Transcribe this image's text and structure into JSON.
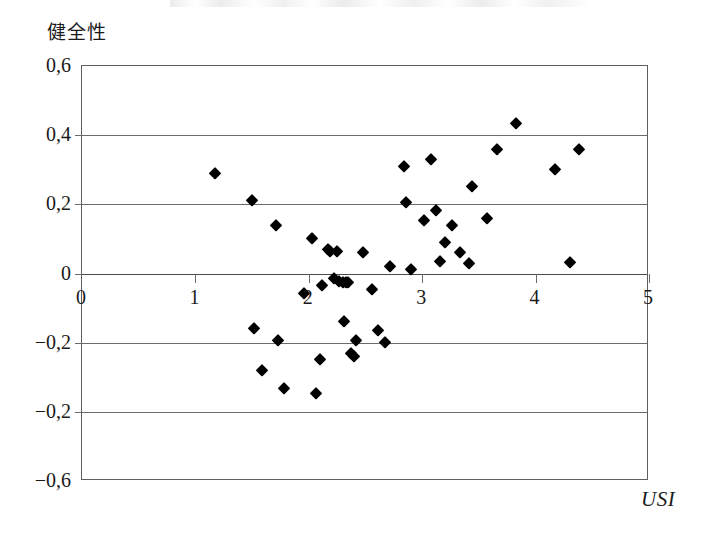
{
  "figure": {
    "y_axis_title": "健全性",
    "x_axis_title": "USI"
  },
  "chart_data": {
    "type": "scatter",
    "title": "",
    "xlabel": "USI",
    "ylabel": "健全性",
    "xlim": [
      0,
      5
    ],
    "ylim": [
      -0.6,
      0.6
    ],
    "xticks": [
      0,
      1,
      2,
      3,
      4,
      5
    ],
    "xtick_labels": [
      "0",
      "1",
      "2",
      "3",
      "4",
      "5"
    ],
    "yticks": [
      0.6,
      0.4,
      0.2,
      0,
      -0.2,
      -0.4,
      -0.6
    ],
    "ytick_labels": [
      "0,6",
      "0,4",
      "0,2",
      "0",
      "−0,2",
      "−0,2",
      "−0,6"
    ],
    "ytick_label_note": "The fourth-from-bottom label is printed as −0,2 in the original (duplicate of the −0,2 above it); by position it denotes −0,4.",
    "grid": "horizontal gridlines at y = 0.4, 0.2, 0, -0.2, -0.4",
    "legend": null,
    "marker": "filled diamond",
    "marker_color": "#000000",
    "n_points": 47,
    "points": [
      [
        1.17,
        0.292
      ],
      [
        1.5,
        0.213
      ],
      [
        1.52,
        -0.157
      ],
      [
        1.59,
        -0.278
      ],
      [
        1.71,
        0.139
      ],
      [
        1.73,
        -0.192
      ],
      [
        1.78,
        -0.331
      ],
      [
        1.96,
        -0.055
      ],
      [
        2.03,
        0.104
      ],
      [
        2.06,
        -0.345
      ],
      [
        2.1,
        -0.246
      ],
      [
        2.12,
        -0.033
      ],
      [
        2.17,
        0.071
      ],
      [
        2.19,
        0.066
      ],
      [
        2.22,
        -0.012
      ],
      [
        2.25,
        0.064
      ],
      [
        2.27,
        -0.021
      ],
      [
        2.3,
        -0.025
      ],
      [
        2.31,
        -0.138
      ],
      [
        2.33,
        -0.026
      ],
      [
        2.35,
        -0.024
      ],
      [
        2.37,
        -0.229
      ],
      [
        2.4,
        -0.238
      ],
      [
        2.42,
        -0.192
      ],
      [
        2.48,
        0.062
      ],
      [
        2.56,
        -0.044
      ],
      [
        2.61,
        -0.162
      ],
      [
        2.67,
        -0.198
      ],
      [
        2.72,
        0.021
      ],
      [
        2.84,
        0.31
      ],
      [
        2.86,
        0.208
      ],
      [
        2.9,
        0.012
      ],
      [
        3.02,
        0.155
      ],
      [
        3.08,
        0.331
      ],
      [
        3.12,
        0.183
      ],
      [
        3.16,
        0.037
      ],
      [
        3.2,
        0.092
      ],
      [
        3.26,
        0.139
      ],
      [
        3.33,
        0.061
      ],
      [
        3.41,
        0.03
      ],
      [
        3.44,
        0.253
      ],
      [
        3.57,
        0.16
      ],
      [
        3.66,
        0.36
      ],
      [
        3.83,
        0.434
      ],
      [
        4.17,
        0.301
      ],
      [
        4.3,
        0.032
      ],
      [
        4.38,
        0.361
      ]
    ]
  }
}
